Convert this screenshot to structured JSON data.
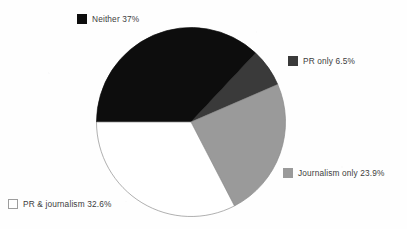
{
  "figure": {
    "cropped_title_trace": "",
    "background_color": "#fefefe"
  },
  "chart_data": {
    "type": "pie",
    "title": "",
    "xlabel": "",
    "ylabel": "",
    "legend_position": "callout-around-pie",
    "grid": false,
    "start_angle_deg": 180,
    "direction": "clockwise",
    "center": {
      "x": 191,
      "y": 122
    },
    "radius": 94.5,
    "categories": [
      "Neither",
      "PR only",
      "Journalism only",
      "PR & journalism"
    ],
    "values": [
      37.0,
      6.5,
      23.9,
      32.6
    ],
    "value_labels": [
      "37%",
      "6.5%",
      "23.9%",
      "32.6%"
    ],
    "colors": [
      "#0d0d0d",
      "#3a3a3a",
      "#9a9a9a",
      "#ffffff"
    ],
    "slices": [
      {
        "name": "Neither",
        "label": "Neither 37%",
        "value": 37.0,
        "value_label": "37%",
        "color": "#0d0d0d",
        "stroke": "#0d0d0d",
        "start_deg": 180,
        "sweep_deg": 133.2
      },
      {
        "name": "PR only",
        "label": "PR only 6.5%",
        "value": 6.5,
        "value_label": "6.5%",
        "color": "#3a3a3a",
        "stroke": "#2a2a2a",
        "start_deg": 313.2,
        "sweep_deg": 23.4
      },
      {
        "name": "Journalism only",
        "label": "Journalism only 23.9%",
        "value": 23.9,
        "value_label": "23.9%",
        "color": "#9a9a9a",
        "stroke": "#8a8a8a",
        "start_deg": 336.6,
        "sweep_deg": 86.0
      },
      {
        "name": "PR & journalism",
        "label": "PR & journalism 32.6%",
        "value": 32.6,
        "value_label": "32.6%",
        "color": "#ffffff",
        "stroke": "#8e8e8e",
        "start_deg": 62.6,
        "sweep_deg": 117.4
      }
    ]
  },
  "legend": {
    "items": [
      {
        "key": "neither",
        "label": "Neither 37%",
        "swatch_color": "#0d0d0d",
        "swatch_border": "#0d0d0d"
      },
      {
        "key": "pr-only",
        "label": "PR only 6.5%",
        "swatch_color": "#3a3a3a",
        "swatch_border": "#3a3a3a"
      },
      {
        "key": "journalism-only",
        "label": "Journalism only 23.9%",
        "swatch_color": "#9a9a9a",
        "swatch_border": "#9a9a9a"
      },
      {
        "key": "pr-journalism",
        "label": "PR & journalism 32.6%",
        "swatch_color": "#ffffff",
        "swatch_border": "#9d9d9d"
      }
    ]
  }
}
